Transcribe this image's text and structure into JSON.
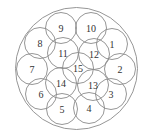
{
  "diagram": {
    "type": "circle-packing",
    "outer": {
      "cx": 76.5,
      "cy": 68.5,
      "r": 61
    },
    "circle_radius": 15.5,
    "circles": [
      {
        "label": "1",
        "cx": 112,
        "cy": 44
      },
      {
        "label": "2",
        "cx": 120,
        "cy": 69
      },
      {
        "label": "3",
        "cx": 111,
        "cy": 94
      },
      {
        "label": "4",
        "cx": 89,
        "cy": 108
      },
      {
        "label": "5",
        "cx": 62,
        "cy": 109
      },
      {
        "label": "6",
        "cx": 41,
        "cy": 94
      },
      {
        "label": "7",
        "cx": 32,
        "cy": 69
      },
      {
        "label": "8",
        "cx": 40,
        "cy": 43
      },
      {
        "label": "9",
        "cx": 61,
        "cy": 28
      },
      {
        "label": "10",
        "cx": 91,
        "cy": 28
      },
      {
        "label": "11",
        "cx": 63,
        "cy": 53
      },
      {
        "label": "12",
        "cx": 94,
        "cy": 54
      },
      {
        "label": "13",
        "cx": 93,
        "cy": 85
      },
      {
        "label": "14",
        "cx": 61,
        "cy": 83
      },
      {
        "label": "15",
        "cx": 78,
        "cy": 68
      }
    ]
  }
}
